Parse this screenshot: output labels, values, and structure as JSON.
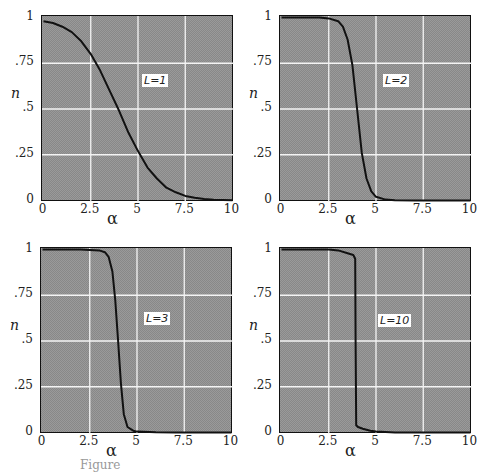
{
  "chart_data": [
    {
      "type": "line",
      "label": "L=1",
      "xlabel": "α",
      "ylabel": "n",
      "xlim": [
        0,
        10
      ],
      "ylim": [
        0,
        1
      ],
      "xticks": [
        "0",
        "2.5",
        "5",
        "7.5",
        "10"
      ],
      "yticks": [
        "0",
        ".25",
        ".5",
        ".75",
        "1"
      ],
      "grid": true,
      "x": [
        0,
        0.5,
        1,
        1.5,
        2,
        2.5,
        3,
        3.5,
        4,
        4.5,
        5,
        5.5,
        6,
        6.5,
        7,
        7.5,
        8,
        8.5,
        9,
        9.5,
        10
      ],
      "y": [
        0.98,
        0.97,
        0.95,
        0.92,
        0.87,
        0.8,
        0.71,
        0.6,
        0.49,
        0.37,
        0.27,
        0.18,
        0.12,
        0.07,
        0.045,
        0.025,
        0.015,
        0.008,
        0.004,
        0.002,
        0.001
      ]
    },
    {
      "type": "line",
      "label": "L=2",
      "xlabel": "α",
      "ylabel": "n",
      "xlim": [
        0,
        10
      ],
      "ylim": [
        0,
        1
      ],
      "xticks": [
        "0",
        "2.5",
        "5",
        "7.5",
        "10"
      ],
      "yticks": [
        "0",
        ".25",
        ".5",
        ".75",
        "1"
      ],
      "grid": true,
      "x": [
        0,
        1,
        2,
        2.5,
        3,
        3.25,
        3.5,
        3.75,
        4,
        4.25,
        4.5,
        4.75,
        5,
        5.5,
        6,
        7,
        8,
        10
      ],
      "y": [
        1,
        1,
        1,
        0.995,
        0.98,
        0.95,
        0.88,
        0.74,
        0.5,
        0.26,
        0.12,
        0.05,
        0.02,
        0.005,
        0.001,
        0,
        0,
        0
      ]
    },
    {
      "type": "line",
      "label": "L=3",
      "xlabel": "α",
      "ylabel": "n",
      "xlim": [
        0,
        10
      ],
      "ylim": [
        0,
        1
      ],
      "xticks": [
        "0",
        "2.5",
        "5",
        "7.5",
        "10"
      ],
      "yticks": [
        "0",
        ".25",
        ".5",
        ".75",
        "1"
      ],
      "grid": true,
      "x": [
        0,
        1,
        2,
        3,
        3.3,
        3.5,
        3.7,
        3.85,
        4,
        4.15,
        4.3,
        4.5,
        4.8,
        5,
        6,
        7,
        10
      ],
      "y": [
        1,
        1,
        1,
        0.995,
        0.985,
        0.96,
        0.88,
        0.72,
        0.5,
        0.27,
        0.1,
        0.03,
        0.01,
        0.005,
        0.001,
        0,
        0
      ]
    },
    {
      "type": "line",
      "label": "L=10",
      "xlabel": "α",
      "ylabel": "n",
      "xlim": [
        0,
        10
      ],
      "ylim": [
        0,
        1
      ],
      "xticks": [
        "0",
        "2.5",
        "5",
        "7.5",
        "10"
      ],
      "yticks": [
        "0",
        ".25",
        ".5",
        ".75",
        "1"
      ],
      "grid": true,
      "x": [
        0,
        2.5,
        3,
        3.5,
        3.8,
        3.9,
        3.92,
        3.95,
        4.05,
        4.3,
        4.7,
        5,
        5.5,
        6,
        7,
        10
      ],
      "y": [
        1,
        1,
        0.995,
        0.98,
        0.97,
        0.95,
        0.5,
        0.04,
        0.03,
        0.02,
        0.01,
        0.005,
        0.002,
        0,
        0,
        0
      ]
    }
  ],
  "panels": [
    {
      "label": "L=1"
    },
    {
      "label": "L=2"
    },
    {
      "label": "L=3"
    },
    {
      "label": "L=10"
    }
  ],
  "axis": {
    "xlabel": "α",
    "ylabel": "n",
    "xticks": [
      "0",
      "2.5",
      "5",
      "7.5",
      "10"
    ],
    "yticks": [
      "0",
      ".25",
      ".5",
      ".75",
      "1"
    ]
  },
  "caption": "Figure"
}
